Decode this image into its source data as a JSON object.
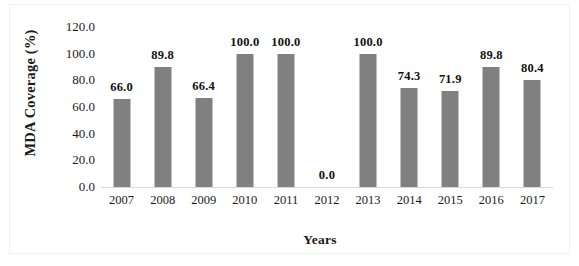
{
  "chart_data": {
    "type": "bar",
    "title": "",
    "subtitle": "",
    "xlabel": "Years",
    "ylabel": "MDA Coverage (%)",
    "categories": [
      "2007",
      "2008",
      "2009",
      "2010",
      "2011",
      "2012",
      "2013",
      "2014",
      "2015",
      "2016",
      "2017"
    ],
    "values": [
      66.0,
      89.8,
      66.4,
      100.0,
      100.0,
      0.0,
      100.0,
      74.3,
      71.9,
      89.8,
      80.4
    ],
    "data_labels": [
      "66.0",
      "89.8",
      "66.4",
      "100.0",
      "100.0",
      "0.0",
      "100.0",
      "74.3",
      "71.9",
      "89.8",
      "80.4"
    ],
    "ylim": [
      0.0,
      120.0
    ],
    "ytick_step": 20.0,
    "ytick_labels": [
      "120.0",
      "100.0",
      "80.0",
      "60.0",
      "40.0",
      "20.0",
      "0.0"
    ],
    "ytick_values": [
      120.0,
      100.0,
      80.0,
      60.0,
      40.0,
      20.0,
      0.0
    ],
    "grid": false,
    "legend": false,
    "legend_position": "none",
    "bar_color": "#808080",
    "background_color": "#ffffff",
    "axis_line_color": "#d9d9d9",
    "label_color": "#1a1a1a"
  }
}
